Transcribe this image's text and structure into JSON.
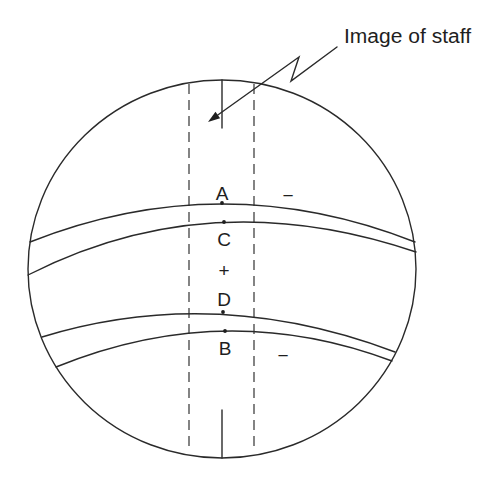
{
  "diagram": {
    "title_label": "Image of staff",
    "points": [
      {
        "label": "A"
      },
      {
        "label": "C"
      },
      {
        "label": "D"
      },
      {
        "label": "B"
      }
    ],
    "signs": {
      "upper_minus": "−",
      "center_plus": "+",
      "lower_minus": "−"
    },
    "colors": {
      "line": "#2a2a2a",
      "background": "#ffffff"
    }
  }
}
